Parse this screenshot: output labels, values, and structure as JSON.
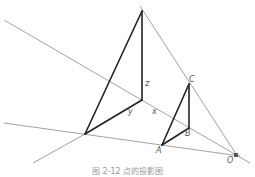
{
  "diagram": {
    "type": "geometry-projection",
    "points": {
      "V": [
        142,
        11
      ],
      "Oaxis": [
        142,
        100
      ],
      "P": [
        85,
        134
      ],
      "C": [
        189,
        84
      ],
      "B": [
        189,
        128
      ],
      "A": [
        162,
        145
      ],
      "O": [
        236,
        155
      ]
    },
    "labels": {
      "z": "z",
      "y": "y",
      "x": "x",
      "C": "C",
      "B": "B",
      "A": "A",
      "O": "O"
    },
    "colors": {
      "thick_line": "#222222",
      "thin_line": "#888888",
      "label": "#555555"
    }
  },
  "caption": "图 2-12  点的投影图"
}
